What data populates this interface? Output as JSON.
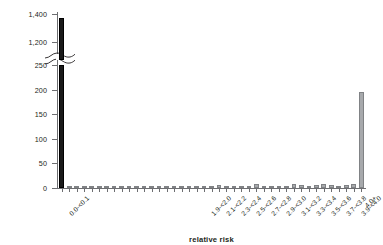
{
  "chart_data": {
    "type": "bar",
    "title": "",
    "xlabel": "relative risk",
    "ylabel": "# census tracts",
    "ylim": [
      0,
      1400
    ],
    "y_axis_break": {
      "below": 250,
      "above": 1200
    },
    "y_ticks_lower": [
      "0",
      "50",
      "100",
      "150",
      "200",
      "250"
    ],
    "y_ticks_upper": [
      "1,200",
      "1,400"
    ],
    "grid": false,
    "legend": null,
    "categories": [
      "0.0-<0.1",
      "0.1-<0.2",
      "0.2-<0.3",
      "0.3-<0.4",
      "0.4-<0.5",
      "0.5-<0.6",
      "0.6-<0.7",
      "0.7-<0.8",
      "0.8-<0.9",
      "0.9-<1.0",
      "1.0-<1.1",
      "1.1-<1.2",
      "1.2-<1.3",
      "1.3-<1.4",
      "1.4-<1.5",
      "1.5-<1.6",
      "1.6-<1.7",
      "1.7-<1.8",
      "1.8-<1.9",
      "1.9-<2.0",
      "2.0-<2.1",
      "2.1-<2.2",
      "2.2-<2.3",
      "2.3-<2.4",
      "2.4-<2.5",
      "2.5-<2.6",
      "2.6-<2.7",
      "2.7-<2.8",
      "2.8-<2.9",
      "2.9-<3.0",
      "3.0-<3.1",
      "3.1-<3.2",
      "3.2-<3.3",
      "3.3-<3.4",
      "3.4-<3.5",
      "3.5-<3.6",
      "3.6-<3.7",
      "3.7-<3.8",
      "3.8-<3.9",
      "3.9-<4.0",
      "4.0+"
    ],
    "values": [
      1375,
      2,
      1,
      1,
      2,
      1,
      2,
      1,
      2,
      3,
      2,
      3,
      2,
      3,
      2,
      3,
      4,
      3,
      2,
      3,
      4,
      7,
      3,
      4,
      3,
      4,
      8,
      4,
      3,
      4,
      5,
      8,
      6,
      5,
      7,
      8,
      6,
      5,
      7,
      9,
      195
    ],
    "tick_label_indices": [
      0,
      19,
      21,
      23,
      25,
      27,
      29,
      31,
      33,
      35,
      37,
      39,
      40
    ],
    "bar_colors": {
      "first": "#1a1a1a",
      "default": "#a7a9ac",
      "border": "#808285"
    }
  }
}
